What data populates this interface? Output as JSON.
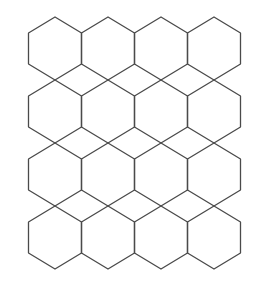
{
  "diagram": {
    "title": "",
    "type": "hexagon-tessellation",
    "background": "#ffffff",
    "stroke_color": "#4a4a4a",
    "stroke_width": 1.3,
    "rows": 4,
    "columns": 4,
    "center_x": [
      55,
      108,
      161,
      214
    ],
    "row_top_y": [
      17,
      80,
      143,
      206
    ],
    "half_width": 26.5,
    "vertex_offsets_y": [
      0,
      16,
      47,
      63
    ],
    "hexagons": [
      {
        "row": 1,
        "col": 1
      },
      {
        "row": 1,
        "col": 2
      },
      {
        "row": 1,
        "col": 3
      },
      {
        "row": 1,
        "col": 4
      },
      {
        "row": 2,
        "col": 1
      },
      {
        "row": 2,
        "col": 2
      },
      {
        "row": 2,
        "col": 3
      },
      {
        "row": 2,
        "col": 4
      },
      {
        "row": 3,
        "col": 1
      },
      {
        "row": 3,
        "col": 2
      },
      {
        "row": 3,
        "col": 3
      },
      {
        "row": 3,
        "col": 4
      },
      {
        "row": 4,
        "col": 1
      },
      {
        "row": 4,
        "col": 2
      },
      {
        "row": 4,
        "col": 3
      },
      {
        "row": 4,
        "col": 4
      }
    ]
  }
}
